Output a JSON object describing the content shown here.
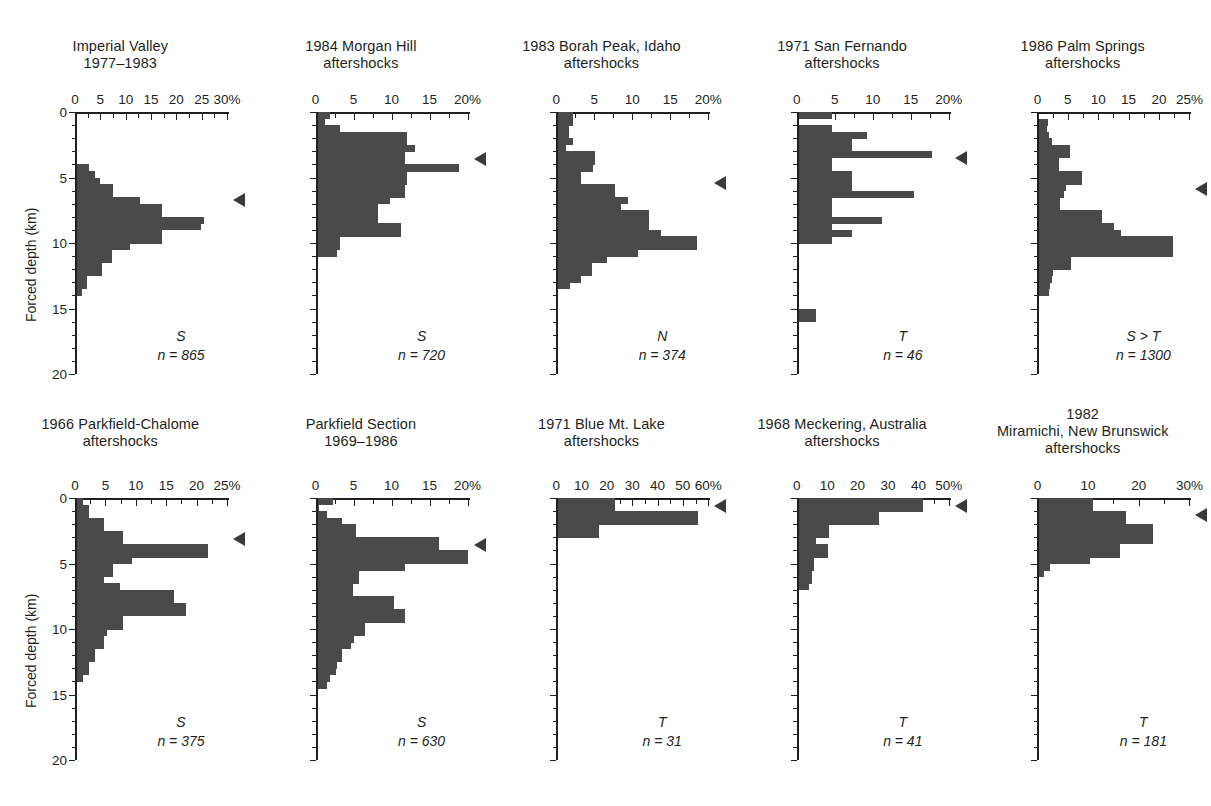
{
  "figure": {
    "y_axis_title": "Forced depth (km)",
    "depth_ticks": [
      0,
      5,
      10,
      15,
      20
    ],
    "depth_range": [
      0,
      20
    ],
    "bin_size_km": 0.5,
    "bar_color": "#4a4a4a",
    "axis_color": "#231f20",
    "marker_name": "mean-depth-marker"
  },
  "chart_data": [
    {
      "id": "imperial-valley",
      "type": "bar",
      "orientation": "horizontal",
      "title_lines": [
        "Imperial Valley",
        "1977–1983"
      ],
      "xlabel": "",
      "ylabel": "Forced depth (km)",
      "xlim": [
        0,
        30
      ],
      "ylim": [
        0,
        20
      ],
      "xticks": [
        0,
        5,
        10,
        15,
        20,
        25,
        30
      ],
      "xtick_labels": [
        "0",
        "5",
        "10",
        "15",
        "20",
        "25",
        "30%"
      ],
      "xunit": "%",
      "mechanism": "S",
      "n_label": "n = 865",
      "n": 865,
      "marker_depth": 6.7,
      "bin_starts": [
        4.0,
        4.5,
        5.0,
        5.5,
        6.0,
        6.5,
        7.0,
        7.5,
        8.0,
        8.5,
        9.0,
        9.5,
        10.0,
        10.5,
        11.0,
        11.5,
        12.0,
        12.5,
        13.0,
        13.5
      ],
      "values": [
        2.3,
        3.5,
        4.5,
        7.2,
        7.2,
        12.5,
        16.8,
        16.8,
        25.0,
        24.5,
        16.8,
        16.8,
        10.5,
        7.0,
        7.0,
        5.0,
        5.0,
        2.0,
        2.0,
        1.0
      ]
    },
    {
      "id": "morgan-hill",
      "type": "bar",
      "orientation": "horizontal",
      "title_lines": [
        "1984 Morgan Hill",
        "aftershocks"
      ],
      "xlabel": "",
      "ylabel": "",
      "xlim": [
        0,
        20
      ],
      "ylim": [
        0,
        20
      ],
      "xticks": [
        0,
        5,
        10,
        15,
        20
      ],
      "xtick_labels": [
        "0",
        "5",
        "10",
        "15",
        "20%"
      ],
      "xunit": "%",
      "mechanism": "S",
      "n_label": "n = 720",
      "n": 720,
      "marker_depth": 3.6,
      "bin_starts": [
        0.0,
        0.5,
        1.0,
        1.5,
        2.0,
        2.5,
        3.0,
        3.5,
        4.0,
        4.5,
        5.0,
        5.5,
        6.0,
        6.5,
        7.0,
        7.5,
        8.0,
        8.5,
        9.0,
        9.5,
        10.0,
        10.5
      ],
      "values": [
        1.6,
        1.0,
        3.0,
        11.8,
        11.8,
        12.8,
        11.5,
        11.5,
        18.6,
        11.8,
        11.8,
        11.5,
        11.5,
        9.5,
        8.0,
        8.0,
        8.0,
        11.0,
        11.0,
        3.0,
        3.0,
        2.5
      ]
    },
    {
      "id": "borah-peak",
      "type": "bar",
      "orientation": "horizontal",
      "title_lines": [
        "1983 Borah Peak, Idaho",
        "aftershocks"
      ],
      "xlabel": "",
      "ylabel": "",
      "xlim": [
        0,
        20
      ],
      "ylim": [
        0,
        20
      ],
      "xticks": [
        0,
        5,
        10,
        15,
        20
      ],
      "xtick_labels": [
        "0",
        "5",
        "10",
        "15",
        "20%"
      ],
      "xunit": "%",
      "mechanism": "N",
      "n_label": "n = 374",
      "n": 374,
      "marker_depth": 5.4,
      "bin_starts": [
        0.0,
        0.5,
        1.0,
        1.5,
        2.0,
        2.5,
        3.0,
        3.5,
        4.0,
        4.5,
        5.0,
        5.5,
        6.0,
        6.5,
        7.0,
        7.5,
        8.0,
        8.5,
        9.0,
        9.5,
        10.0,
        10.5,
        11.0,
        11.5,
        12.0,
        12.5,
        13.0
      ],
      "values": [
        2.0,
        2.0,
        1.4,
        1.4,
        1.9,
        1.0,
        4.8,
        4.8,
        4.6,
        3.0,
        3.0,
        7.5,
        7.5,
        9.2,
        8.2,
        12.0,
        12.0,
        12.0,
        13.5,
        18.2,
        18.2,
        10.5,
        6.4,
        4.4,
        4.4,
        3.0,
        1.6
      ]
    },
    {
      "id": "san-fernando",
      "type": "bar",
      "orientation": "horizontal",
      "title_lines": [
        "1971 San Fernando",
        "aftershocks"
      ],
      "xlabel": "",
      "ylabel": "",
      "xlim": [
        0,
        20
      ],
      "ylim": [
        0,
        20
      ],
      "xticks": [
        0,
        5,
        10,
        15,
        20
      ],
      "xtick_labels": [
        "0",
        "5",
        "10",
        "15",
        "20%"
      ],
      "xunit": "%",
      "mechanism": "T",
      "n_label": "n = 46",
      "n": 46,
      "marker_depth": 3.5,
      "bin_starts": [
        0.0,
        0.5,
        1.0,
        1.5,
        2.0,
        2.5,
        3.0,
        3.5,
        4.0,
        4.5,
        5.0,
        5.5,
        6.0,
        6.5,
        7.0,
        7.5,
        8.0,
        8.5,
        9.0,
        9.5,
        15.0,
        15.5
      ],
      "values": [
        4.4,
        0.0,
        4.4,
        9.0,
        7.0,
        7.0,
        17.5,
        4.4,
        4.4,
        7.0,
        7.0,
        7.0,
        15.2,
        4.4,
        4.4,
        4.4,
        11.0,
        4.4,
        7.0,
        4.4,
        2.2,
        2.2
      ]
    },
    {
      "id": "palm-springs",
      "type": "bar",
      "orientation": "horizontal",
      "title_lines": [
        "1986 Palm Springs",
        "aftershocks"
      ],
      "xlabel": "",
      "ylabel": "",
      "xlim": [
        0,
        25
      ],
      "ylim": [
        0,
        20
      ],
      "xticks": [
        0,
        5,
        10,
        15,
        20,
        25
      ],
      "xtick_labels": [
        "0",
        "5",
        "10",
        "15",
        "20",
        "25%"
      ],
      "xunit": "%",
      "mechanism": "S > T",
      "n_label": "n = 1300",
      "n": 1300,
      "marker_depth": 5.9,
      "bin_starts": [
        0.5,
        1.0,
        1.5,
        2.0,
        2.5,
        3.0,
        3.5,
        4.0,
        4.5,
        5.0,
        5.5,
        6.0,
        6.5,
        7.0,
        7.5,
        8.0,
        8.5,
        9.0,
        9.5,
        10.0,
        10.5,
        11.0,
        11.5,
        12.0,
        12.5,
        13.0,
        13.5
      ],
      "values": [
        1.4,
        1.3,
        1.6,
        2.0,
        5.1,
        5.1,
        3.2,
        3.2,
        7.0,
        7.0,
        4.3,
        4.0,
        3.4,
        3.4,
        10.3,
        10.3,
        12.2,
        13.4,
        22.0,
        22.0,
        22.0,
        5.2,
        5.2,
        2.2,
        2.0,
        1.8,
        1.5
      ]
    },
    {
      "id": "parkfield-chalome",
      "type": "bar",
      "orientation": "horizontal",
      "title_lines": [
        "1966 Parkfield-Chalome",
        "aftershocks"
      ],
      "xlabel": "",
      "ylabel": "Forced depth (km)",
      "xlim": [
        0,
        25
      ],
      "ylim": [
        0,
        20
      ],
      "xticks": [
        0,
        5,
        10,
        15,
        20,
        25
      ],
      "xtick_labels": [
        "0",
        "5",
        "10",
        "15",
        "20",
        "25%"
      ],
      "xunit": "%",
      "mechanism": "S",
      "n_label": "n = 375",
      "n": 375,
      "marker_depth": 3.1,
      "bin_starts": [
        0.0,
        0.5,
        1.0,
        1.5,
        2.0,
        2.5,
        3.0,
        3.5,
        4.0,
        4.5,
        5.0,
        5.5,
        6.0,
        6.5,
        7.0,
        7.5,
        8.0,
        8.5,
        9.0,
        9.5,
        10.0,
        10.5,
        11.0,
        11.5,
        12.0,
        12.5,
        13.0,
        13.5
      ],
      "values": [
        1.0,
        2.0,
        2.0,
        4.5,
        4.5,
        7.5,
        7.5,
        21.5,
        21.5,
        9.0,
        6.0,
        6.0,
        4.5,
        7.0,
        16.0,
        16.0,
        18.0,
        18.0,
        7.5,
        7.5,
        5.0,
        4.5,
        4.5,
        3.0,
        3.0,
        2.0,
        2.0,
        1.0
      ]
    },
    {
      "id": "parkfield-section",
      "type": "bar",
      "orientation": "horizontal",
      "title_lines": [
        "Parkfield Section",
        "1969–1986"
      ],
      "xlabel": "",
      "ylabel": "",
      "xlim": [
        0,
        20
      ],
      "ylim": [
        0,
        20
      ],
      "xticks": [
        0,
        5,
        10,
        15,
        20
      ],
      "xtick_labels": [
        "0",
        "5",
        "10",
        "15",
        "20%"
      ],
      "xunit": "%",
      "mechanism": "S",
      "n_label": "n = 630",
      "n": 630,
      "marker_depth": 3.6,
      "bin_starts": [
        0.0,
        0.5,
        1.0,
        1.5,
        2.0,
        2.5,
        3.0,
        3.5,
        4.0,
        4.5,
        5.0,
        5.5,
        6.0,
        6.5,
        7.0,
        7.5,
        8.0,
        8.5,
        9.0,
        9.5,
        10.0,
        10.5,
        11.0,
        11.5,
        12.0,
        12.5,
        13.0,
        13.5,
        14.0
      ],
      "values": [
        2.0,
        0.2,
        1.2,
        3.2,
        5.0,
        5.0,
        16.0,
        16.0,
        19.8,
        19.8,
        11.5,
        5.4,
        5.4,
        4.6,
        4.6,
        10.0,
        10.0,
        11.5,
        11.5,
        6.2,
        6.2,
        4.8,
        4.4,
        3.2,
        3.2,
        2.6,
        2.4,
        1.6,
        1.2
      ]
    },
    {
      "id": "blue-mt-lake",
      "type": "bar",
      "orientation": "horizontal",
      "title_lines": [
        "1971 Blue Mt. Lake",
        "aftershocks"
      ],
      "xlabel": "",
      "ylabel": "",
      "xlim": [
        0,
        60
      ],
      "ylim": [
        0,
        20
      ],
      "xticks": [
        0,
        10,
        20,
        30,
        40,
        50,
        60
      ],
      "xtick_labels": [
        "0",
        "10",
        "20",
        "30",
        "40",
        "50",
        "60%"
      ],
      "xunit": "%",
      "mechanism": "T",
      "n_label": "n = 31",
      "n": 31,
      "marker_depth": 0.6,
      "bin_starts": [
        0.0,
        0.5,
        1.0,
        1.5,
        2.0,
        2.5
      ],
      "values": [
        22.5,
        22.5,
        55.0,
        55.0,
        16.0,
        16.0
      ]
    },
    {
      "id": "meckering",
      "type": "bar",
      "orientation": "horizontal",
      "title_lines": [
        "1968 Meckering, Australia",
        "aftershocks"
      ],
      "xlabel": "",
      "ylabel": "",
      "xlim": [
        0,
        50
      ],
      "ylim": [
        0,
        20
      ],
      "xticks": [
        0,
        10,
        20,
        30,
        40,
        50
      ],
      "xtick_labels": [
        "0",
        "10",
        "20",
        "30",
        "40",
        "50%"
      ],
      "xunit": "%",
      "mechanism": "T",
      "n_label": "n = 41",
      "n": 41,
      "marker_depth": 0.6,
      "bin_starts": [
        0.0,
        0.5,
        1.0,
        1.5,
        2.0,
        2.5,
        3.0,
        3.5,
        4.0,
        4.5,
        5.0,
        5.5,
        6.0,
        6.5
      ],
      "values": [
        41.0,
        41.0,
        26.5,
        26.5,
        10.0,
        10.0,
        5.5,
        9.5,
        9.5,
        5.0,
        5.0,
        4.5,
        4.5,
        3.5
      ]
    },
    {
      "id": "miramichi",
      "type": "bar",
      "orientation": "horizontal",
      "title_lines": [
        "1982",
        "Miramichi, New Brunswick",
        "aftershocks"
      ],
      "xlabel": "",
      "ylabel": "",
      "xlim": [
        0,
        30
      ],
      "ylim": [
        0,
        20
      ],
      "xticks": [
        0,
        10,
        20,
        30
      ],
      "xtick_labels": [
        "0",
        "10",
        "20",
        "30%"
      ],
      "xunit": "%",
      "mechanism": "T",
      "n_label": "n = 181",
      "n": 181,
      "marker_depth": 1.3,
      "bin_starts": [
        0.0,
        0.5,
        1.0,
        1.5,
        2.0,
        2.5,
        3.0,
        3.5,
        4.0,
        4.5,
        5.0,
        5.5
      ],
      "values": [
        10.5,
        10.5,
        17.0,
        17.0,
        22.5,
        22.5,
        22.5,
        16.0,
        16.0,
        10.0,
        2.0,
        1.0
      ]
    }
  ]
}
